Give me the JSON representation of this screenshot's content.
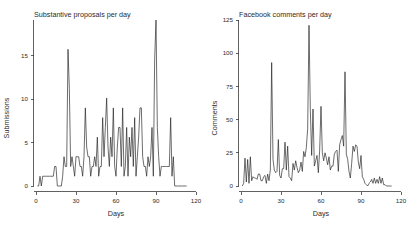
{
  "figure": {
    "width": 416,
    "height": 230,
    "background": "#ffffff",
    "line_color": "#1e1e1e",
    "axis_color": "#3a3a3a"
  },
  "chart_data": [
    {
      "type": "line",
      "title": "Substantive proposals per day",
      "xlabel": "Days",
      "ylabel": "Submissions",
      "xlim": [
        0,
        120
      ],
      "ylim": [
        0,
        17
      ],
      "xticks": [
        0,
        30,
        60,
        90,
        120
      ],
      "xtick_labels": [
        "0",
        "30",
        "60",
        "90",
        "120"
      ],
      "yticks": [
        0,
        5,
        10,
        15
      ],
      "ytick_labels": [
        "0",
        "5",
        "10",
        "15"
      ],
      "grid": false,
      "legend": "none",
      "x": [
        1,
        2,
        3,
        4,
        5,
        6,
        7,
        8,
        9,
        10,
        11,
        12,
        13,
        14,
        15,
        16,
        17,
        18,
        19,
        20,
        21,
        22,
        23,
        24,
        25,
        26,
        27,
        28,
        29,
        30,
        31,
        32,
        33,
        34,
        35,
        36,
        37,
        38,
        39,
        40,
        41,
        42,
        43,
        44,
        45,
        46,
        47,
        48,
        49,
        50,
        51,
        52,
        53,
        54,
        55,
        56,
        57,
        58,
        59,
        60,
        61,
        62,
        63,
        64,
        65,
        66,
        67,
        68,
        69,
        70,
        71,
        72,
        73,
        74,
        75,
        76,
        77,
        78,
        79,
        80,
        81,
        82,
        83,
        84,
        85,
        86,
        87,
        88,
        89,
        90,
        91,
        92,
        93,
        94,
        95,
        96,
        97,
        98,
        99,
        100,
        101,
        102,
        103,
        104,
        105,
        106,
        107,
        108,
        109,
        110,
        111,
        112,
        113
      ],
      "values": [
        0,
        0,
        1,
        0,
        1,
        1,
        1,
        1,
        1,
        1,
        1,
        1,
        1,
        2,
        2,
        0,
        0,
        0,
        0,
        1,
        3,
        2,
        2,
        14,
        10,
        2,
        3,
        2,
        1,
        3,
        3,
        3,
        2,
        2,
        1,
        3,
        8,
        4,
        3,
        3,
        1,
        2,
        2,
        3,
        2,
        5,
        1,
        2,
        2,
        7,
        3,
        6,
        9,
        4,
        2,
        5,
        3,
        8,
        2,
        1,
        4,
        6,
        6,
        2,
        8,
        1,
        2,
        6,
        1,
        5,
        3,
        6,
        2,
        7,
        1,
        3,
        5,
        8,
        8,
        3,
        2,
        2,
        1,
        3,
        2,
        3,
        6,
        1,
        13,
        17,
        6,
        3,
        1,
        2,
        2,
        2,
        2,
        2,
        2,
        2,
        7,
        1,
        3,
        0,
        0,
        0,
        0,
        0,
        0,
        0,
        0,
        0,
        0
      ]
    },
    {
      "type": "line",
      "title": "Facebook comments per day",
      "xlabel": "Days",
      "ylabel": "Comments",
      "xlim": [
        0,
        120
      ],
      "ylim": [
        0,
        125
      ],
      "xticks": [
        0,
        30,
        60,
        90,
        120
      ],
      "xtick_labels": [
        "0",
        "30",
        "60",
        "90",
        "120"
      ],
      "yticks": [
        0,
        25,
        50,
        75,
        100,
        125
      ],
      "ytick_labels": [
        "0",
        "25",
        "50",
        "75",
        "100",
        "125"
      ],
      "grid": false,
      "legend": "none",
      "x": [
        1,
        2,
        3,
        4,
        5,
        6,
        7,
        8,
        9,
        10,
        11,
        12,
        13,
        14,
        15,
        16,
        17,
        18,
        19,
        20,
        21,
        22,
        23,
        24,
        25,
        26,
        27,
        28,
        29,
        30,
        31,
        32,
        33,
        34,
        35,
        36,
        37,
        38,
        39,
        40,
        41,
        42,
        43,
        44,
        45,
        46,
        47,
        48,
        49,
        50,
        51,
        52,
        53,
        54,
        55,
        56,
        57,
        58,
        59,
        60,
        61,
        62,
        63,
        64,
        65,
        66,
        67,
        68,
        69,
        70,
        71,
        72,
        73,
        74,
        75,
        76,
        77,
        78,
        79,
        80,
        81,
        82,
        83,
        84,
        85,
        86,
        87,
        88,
        89,
        90,
        91,
        92,
        93,
        94,
        95,
        96,
        97,
        98,
        99,
        100,
        101,
        102,
        103,
        104,
        105,
        106,
        107,
        108,
        109,
        110,
        111,
        112,
        113
      ],
      "values": [
        0,
        2,
        21,
        3,
        20,
        2,
        22,
        4,
        7,
        6,
        6,
        5,
        9,
        9,
        4,
        4,
        7,
        8,
        2,
        9,
        4,
        12,
        93,
        20,
        12,
        10,
        11,
        35,
        8,
        6,
        13,
        13,
        33,
        12,
        30,
        7,
        6,
        4,
        17,
        12,
        19,
        14,
        10,
        12,
        18,
        11,
        26,
        22,
        29,
        43,
        121,
        57,
        23,
        58,
        15,
        19,
        23,
        10,
        27,
        60,
        25,
        19,
        25,
        21,
        16,
        22,
        12,
        15,
        15,
        24,
        26,
        27,
        11,
        31,
        35,
        38,
        30,
        86,
        24,
        20,
        11,
        6,
        17,
        30,
        26,
        31,
        30,
        18,
        13,
        23,
        7,
        5,
        2,
        1,
        0,
        2,
        3,
        5,
        2,
        6,
        2,
        5,
        2,
        7,
        2,
        6,
        1,
        1,
        0,
        0,
        0,
        0,
        0
      ]
    }
  ]
}
